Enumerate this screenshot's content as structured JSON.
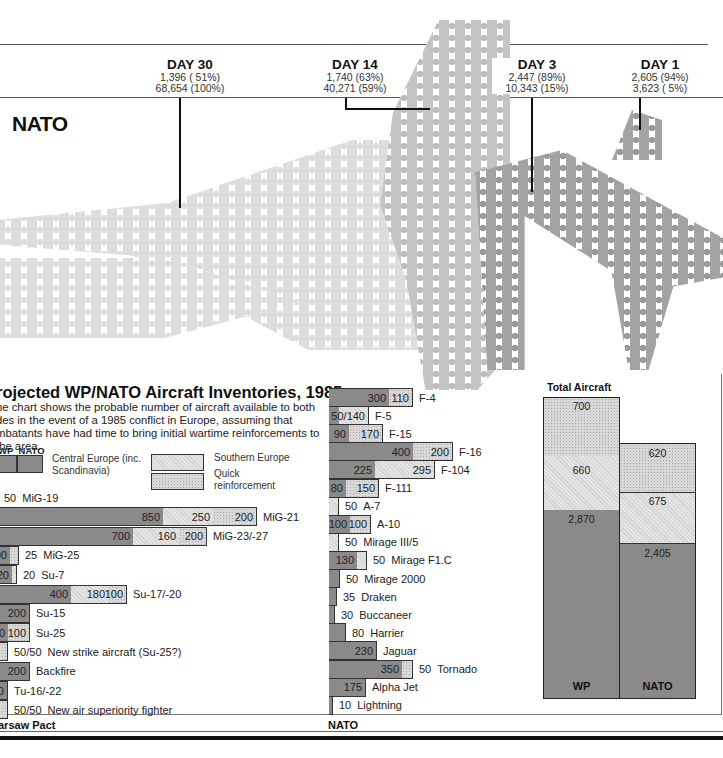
{
  "timeline": {
    "side_label": "NATO",
    "days": [
      {
        "title": "DAY 30",
        "line1": "1,396 ( 51%)",
        "line2": "68,654 (100%)"
      },
      {
        "title": "DAY 14",
        "line1": "1,740 (63%)",
        "line2": "40,271 (59%)"
      },
      {
        "title": "DAY 3",
        "line1": "2,447 (89%)",
        "line2": "10,343 (15%)"
      },
      {
        "title": "DAY 1",
        "line1": "2,605 (94%)",
        "line2": "3,623 (  5%)"
      }
    ]
  },
  "panel": {
    "title": "rojected WP/NATO Aircraft Inventories, 1985",
    "description": "he chart shows the probable number of aircraft available to both des in the event of a 1985 conflict in Europe, assuming that mbatants have had time to bring initial wartime reinforcements to the area.",
    "legend": {
      "wp_label": "WP",
      "nato_label": "NATO",
      "central": "Central Europe (inc. Scandinavia)",
      "southern": "Southern Europe",
      "quick": "Quick reinforcement"
    },
    "wp_footer": "arsaw Pact",
    "nato_footer": "NATO",
    "total_title": "Total Aircraft"
  },
  "chart_data": [
    {
      "type": "bar",
      "title": "Warsaw Pact aircraft by type (Central / Southern / Quick reinforcement)",
      "orientation": "horizontal-stacked",
      "series_names": [
        "Central Europe (inc. Scandinavia)",
        "Southern Europe",
        "Quick reinforcement"
      ],
      "rows": [
        {
          "label": "MiG-19",
          "display": "50",
          "values": [
            0,
            50,
            0
          ]
        },
        {
          "label": "MiG-21",
          "display": "",
          "values": [
            850,
            250,
            200
          ]
        },
        {
          "label": "MiG-23/-27",
          "display": "",
          "values": [
            700,
            160,
            200
          ]
        },
        {
          "label": "MiG-25",
          "display": "25",
          "values": [
            100,
            0,
            25
          ]
        },
        {
          "label": "Su-7",
          "display": "20",
          "values": [
            20,
            0,
            20
          ]
        },
        {
          "label": "Su-17/-20",
          "display": "",
          "values": [
            400,
            180,
            100
          ]
        },
        {
          "label": "Su-15",
          "display": "",
          "values": [
            200,
            0,
            0
          ]
        },
        {
          "label": "Su-25",
          "display": "",
          "values": [
            90,
            0,
            100
          ]
        },
        {
          "label": "New strike aircraft (Su-25?)",
          "display": "50/50",
          "values": [
            0,
            0,
            50
          ]
        },
        {
          "label": "Backfire",
          "display": "",
          "values": [
            200,
            0,
            0
          ]
        },
        {
          "label": "Tu-16/-22",
          "display": "",
          "values": [
            90,
            0,
            0
          ]
        },
        {
          "label": "New air superiority fighter",
          "display": "50/50",
          "values": [
            0,
            0,
            50
          ]
        }
      ],
      "xlabel": "",
      "ylabel": "",
      "footer": "Warsaw Pact"
    },
    {
      "type": "bar",
      "title": "NATO aircraft by type",
      "orientation": "horizontal-stacked",
      "series_names": [
        "Central Europe (inc. Scandinavia)",
        "Southern Europe",
        "Quick reinforcement"
      ],
      "rows": [
        {
          "label": "F-4",
          "display": "",
          "values": [
            300,
            0,
            110
          ]
        },
        {
          "label": "F-5",
          "display": "50/140",
          "values": [
            50,
            140,
            0
          ]
        },
        {
          "label": "F-15",
          "display": "",
          "values": [
            90,
            0,
            170
          ]
        },
        {
          "label": "F-16",
          "display": "",
          "values": [
            400,
            0,
            200
          ]
        },
        {
          "label": "F-104",
          "display": "",
          "values": [
            225,
            295,
            0
          ]
        },
        {
          "label": "F-111",
          "display": "",
          "values": [
            80,
            0,
            150
          ]
        },
        {
          "label": "A-7",
          "display": "50",
          "values": [
            0,
            50,
            0
          ]
        },
        {
          "label": "A-10",
          "display": "",
          "values": [
            100,
            0,
            100
          ]
        },
        {
          "label": "Mirage III/5",
          "display": "50",
          "values": [
            0,
            50,
            0
          ]
        },
        {
          "label": "Mirage F1.C",
          "display": "50",
          "values": [
            130,
            50,
            0
          ]
        },
        {
          "label": "Mirage 2000",
          "display": "50",
          "values": [
            50,
            0,
            0
          ]
        },
        {
          "label": "Draken",
          "display": "35",
          "values": [
            35,
            0,
            0
          ]
        },
        {
          "label": "Buccaneer",
          "display": "30",
          "values": [
            30,
            0,
            0
          ]
        },
        {
          "label": "Harrier",
          "display": "80",
          "values": [
            80,
            0,
            0
          ]
        },
        {
          "label": "Jaguar",
          "display": "",
          "values": [
            230,
            0,
            0
          ]
        },
        {
          "label": "Tornado",
          "display": "50",
          "values": [
            350,
            0,
            50
          ]
        },
        {
          "label": "Alpha Jet",
          "display": "",
          "values": [
            175,
            0,
            0
          ]
        },
        {
          "label": "Lightning",
          "display": "10",
          "values": [
            10,
            0,
            0
          ]
        }
      ],
      "footer": "NATO"
    },
    {
      "type": "bar",
      "title": "Total Aircraft",
      "orientation": "vertical-stacked",
      "categories": [
        "WP",
        "NATO"
      ],
      "series": [
        {
          "name": "Central Europe (inc. Scandinavia)",
          "values": [
            2870,
            2405
          ]
        },
        {
          "name": "Southern Europe",
          "values": [
            660,
            675
          ]
        },
        {
          "name": "Quick reinforcement",
          "values": [
            700,
            620
          ]
        }
      ]
    },
    {
      "type": "table",
      "title": "NATO sorties timeline",
      "rows": [
        {
          "day": "DAY 30",
          "aircraft": "1,396",
          "aircraft_pct": "51%",
          "total": "68,654",
          "total_pct": "100%"
        },
        {
          "day": "DAY 14",
          "aircraft": "1,740",
          "aircraft_pct": "63%",
          "total": "40,271",
          "total_pct": "59%"
        },
        {
          "day": "DAY 3",
          "aircraft": "2,447",
          "aircraft_pct": "89%",
          "total": "10,343",
          "total_pct": "15%"
        },
        {
          "day": "DAY 1",
          "aircraft": "2,605",
          "aircraft_pct": "94%",
          "total": "3,623",
          "total_pct": "5%"
        }
      ]
    }
  ],
  "wp_bars": [
    {
      "label": "MiG-19",
      "x": 0,
      "segs": [],
      "val": "50"
    },
    {
      "label": "MiG-21",
      "x": 0,
      "segs": [
        {
          "w": 165,
          "c": "dark",
          "t": "850"
        },
        {
          "w": 50,
          "c": "south",
          "t": "250"
        },
        {
          "w": 44,
          "c": "quick",
          "t": "200"
        }
      ],
      "val": ""
    },
    {
      "label": "MiG-23/-27",
      "x": 0,
      "segs": [
        {
          "w": 135,
          "c": "dark",
          "t": "700"
        },
        {
          "w": 46,
          "c": "south",
          "t": "160"
        },
        {
          "w": 28,
          "c": "quick",
          "t": "200"
        }
      ],
      "val": ""
    },
    {
      "label": "MiG-25",
      "x": 0,
      "segs": [
        {
          "w": 12,
          "c": "dark",
          "t": "00"
        },
        {
          "w": 9,
          "c": "quick",
          "t": ""
        }
      ],
      "val": "25"
    },
    {
      "label": "Su-7",
      "x": 0,
      "segs": [
        {
          "w": 14,
          "c": "dark",
          "t": "20"
        },
        {
          "w": 5,
          "c": "south",
          "t": ""
        }
      ],
      "val": "20"
    },
    {
      "label": "Su-17/-20",
      "x": 0,
      "segs": [
        {
          "w": 73,
          "c": "dark",
          "t": "400"
        },
        {
          "w": 37,
          "c": "south",
          "t": "180"
        },
        {
          "w": 19,
          "c": "quick",
          "t": "100"
        }
      ],
      "val": ""
    },
    {
      "label": "Su-15",
      "x": 0,
      "segs": [
        {
          "w": 32,
          "c": "dark",
          "t": "200"
        }
      ],
      "val": ""
    },
    {
      "label": "Su-25",
      "x": 0,
      "segs": [
        {
          "w": 10,
          "c": "dark",
          "t": "0"
        },
        {
          "w": 22,
          "c": "quick",
          "t": "100"
        }
      ],
      "val": ""
    },
    {
      "label": "New strike aircraft (Su-25?)",
      "x": 0,
      "segs": [
        {
          "w": 10,
          "c": "quick",
          "t": ""
        }
      ],
      "val": "50/50"
    },
    {
      "label": "Backfire",
      "x": 0,
      "segs": [
        {
          "w": 32,
          "c": "dark",
          "t": "200"
        }
      ],
      "val": ""
    },
    {
      "label": "Tu-16/-22",
      "x": 0,
      "segs": [
        {
          "w": 10,
          "c": "dark",
          "t": "90"
        }
      ],
      "val": ""
    },
    {
      "label": "New air superiority fighter",
      "x": 0,
      "segs": [
        {
          "w": 10,
          "c": "quick",
          "t": ""
        }
      ],
      "val": "50/50"
    }
  ],
  "nato_bars": [
    {
      "label": "F-4",
      "segs": [
        {
          "w": 60,
          "c": "dark",
          "t": "300"
        },
        {
          "w": 24,
          "c": "quick",
          "t": "110"
        }
      ],
      "val": ""
    },
    {
      "label": "F-5",
      "segs": [
        {
          "w": 10,
          "c": "dark",
          "t": ""
        },
        {
          "w": 30,
          "c": "south",
          "t": "50/140"
        }
      ],
      "val": ""
    },
    {
      "label": "F-15",
      "segs": [
        {
          "w": 20,
          "c": "dark",
          "t": "90"
        },
        {
          "w": 34,
          "c": "quick",
          "t": "170"
        }
      ],
      "val": ""
    },
    {
      "label": "F-16",
      "segs": [
        {
          "w": 84,
          "c": "dark",
          "t": "400"
        },
        {
          "w": 40,
          "c": "quick",
          "t": "200"
        }
      ],
      "val": ""
    },
    {
      "label": "F-104",
      "segs": [
        {
          "w": 46,
          "c": "dark",
          "t": "225"
        },
        {
          "w": 60,
          "c": "south",
          "t": "295"
        }
      ],
      "val": ""
    },
    {
      "label": "F-111",
      "segs": [
        {
          "w": 17,
          "c": "dark",
          "t": "80"
        },
        {
          "w": 33,
          "c": "quick",
          "t": "150"
        }
      ],
      "val": ""
    },
    {
      "label": "A-7",
      "segs": [
        {
          "w": 10,
          "c": "south",
          "t": ""
        }
      ],
      "val": "50"
    },
    {
      "label": "A-10",
      "segs": [
        {
          "w": 21,
          "c": "dark",
          "t": "100"
        },
        {
          "w": 21,
          "c": "quick",
          "t": "100"
        }
      ],
      "val": ""
    },
    {
      "label": "Mirage III/5",
      "segs": [
        {
          "w": 10,
          "c": "south",
          "t": ""
        }
      ],
      "val": "50"
    },
    {
      "label": "Mirage F1.C",
      "segs": [
        {
          "w": 28,
          "c": "dark",
          "t": "130"
        },
        {
          "w": 10,
          "c": "south",
          "t": ""
        }
      ],
      "val": "50"
    },
    {
      "label": "Mirage 2000",
      "segs": [
        {
          "w": 11,
          "c": "dark",
          "t": ""
        }
      ],
      "val": "50"
    },
    {
      "label": "Draken",
      "segs": [
        {
          "w": 8,
          "c": "dark",
          "t": ""
        }
      ],
      "val": "35"
    },
    {
      "label": "Buccaneer",
      "segs": [
        {
          "w": 6,
          "c": "dark",
          "t": ""
        }
      ],
      "val": "30"
    },
    {
      "label": "Harrier",
      "segs": [
        {
          "w": 17,
          "c": "dark",
          "t": ""
        }
      ],
      "val": "80"
    },
    {
      "label": "Jaguar",
      "segs": [
        {
          "w": 48,
          "c": "dark",
          "t": "230"
        }
      ],
      "val": ""
    },
    {
      "label": "Tornado",
      "segs": [
        {
          "w": 73,
          "c": "dark",
          "t": "350"
        },
        {
          "w": 11,
          "c": "quick",
          "t": ""
        }
      ],
      "val": "50"
    },
    {
      "label": "Alpha Jet",
      "segs": [
        {
          "w": 37,
          "c": "dark",
          "t": "175"
        }
      ],
      "val": ""
    },
    {
      "label": "Lightning",
      "segs": [
        {
          "w": 4,
          "c": "dark",
          "t": ""
        }
      ],
      "val": "10"
    }
  ],
  "totals": {
    "wp": {
      "label": "WP",
      "quick": "700",
      "south": "660",
      "central": "2,870"
    },
    "nato": {
      "label": "NATO",
      "quick": "620",
      "south": "675",
      "central": "2,405"
    }
  }
}
